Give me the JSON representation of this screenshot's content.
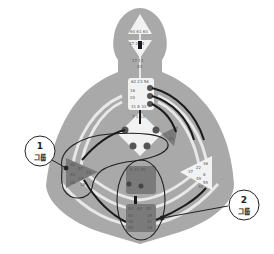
{
  "diagram": {
    "type": "human-design-bodygraph",
    "colors": {
      "body_fill": "#a9a9a9",
      "channel_light": "#e8e8e8",
      "center_defined": "#7a7a7a",
      "center_open": "#f2f2f2",
      "line_dark": "#1a1a1a",
      "background": "#ffffff"
    },
    "gates": {
      "head": "64 61 63",
      "ajna_top": "47 24 4",
      "ajna_bottom": "17 11",
      "ajna_mid": "43",
      "throat_top": "62 23 56",
      "throat_left": [
        "16",
        "20"
      ],
      "throat_bottom": "31 8 33",
      "g_center_top": "7 1 13",
      "spleen_gates": [
        "48",
        "57",
        "44",
        "50",
        "32",
        "28",
        "18"
      ],
      "sacral_top": "5 14 29",
      "ego_side": "21",
      "solar_plexus_gates": [
        "36",
        "22",
        "37",
        "6",
        "49",
        "55",
        "30"
      ],
      "root_gates": [
        "53",
        "60",
        "52",
        "54",
        "38",
        "58",
        "39",
        "41",
        "19"
      ]
    },
    "callouts": [
      {
        "number": "1",
        "label": "그룹"
      },
      {
        "number": "2",
        "label": "그룹"
      }
    ]
  }
}
